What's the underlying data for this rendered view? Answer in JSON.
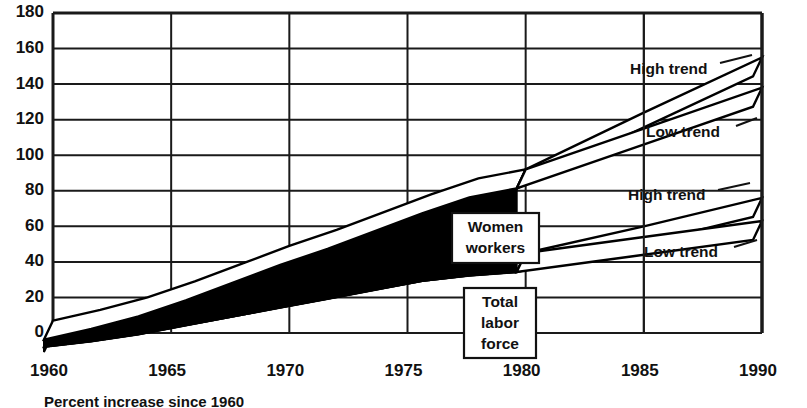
{
  "chart_data": {
    "type": "area",
    "title": "",
    "subtitle": "",
    "xlabel": "",
    "ylabel": "",
    "xlim": [
      1960,
      1990
    ],
    "ylim": [
      0,
      180
    ],
    "grid": true,
    "legend_position": "in-plot callouts",
    "style": "3d-stacked-area-with-projection-fan",
    "y_ticks": [
      0,
      20,
      40,
      60,
      80,
      100,
      120,
      140,
      160,
      180
    ],
    "x_ticks": [
      1960,
      1965,
      1970,
      1975,
      1980,
      1985,
      1990
    ],
    "x_tick_labels": [
      "1960",
      "1965",
      "1970",
      "1975",
      "1980",
      "1985",
      "1990"
    ],
    "y_tick_labels": [
      "0",
      "20",
      "40",
      "60",
      "80",
      "100",
      "120",
      "140",
      "160",
      "180"
    ],
    "annotations": [
      {
        "text": "Women workers",
        "lines": [
          "Women",
          "workers"
        ],
        "x": 1978,
        "y": 52
      },
      {
        "text": "Total labor force",
        "lines": [
          "Total",
          "labor",
          "force"
        ],
        "x": 1978,
        "y": 18
      },
      {
        "text": "High trend",
        "series": "total-labor-force-high",
        "x": 1986.5,
        "y": 150
      },
      {
        "text": "Low trend",
        "series": "total-labor-force-low",
        "x": 1986.5,
        "y": 124
      },
      {
        "text": "High trend",
        "series": "women-workers-high",
        "x": 1986.5,
        "y": 70
      },
      {
        "text": "Low trend",
        "series": "women-workers-low",
        "x": 1986.5,
        "y": 47
      }
    ],
    "x": [
      1960,
      1962,
      1964,
      1966,
      1968,
      1970,
      1972,
      1974,
      1976,
      1978,
      1980
    ],
    "series": [
      {
        "name": "Total labor force",
        "role": "lower-band-top",
        "fill": "#000000",
        "values": [
          3,
          6,
          10,
          15,
          20,
          25,
          30,
          35,
          40,
          43,
          45
        ]
      },
      {
        "name": "Women workers",
        "role": "upper-band-top (cumulative)",
        "fill": "#000000",
        "values": [
          7,
          13,
          20,
          29,
          39,
          49,
          58,
          68,
          78,
          87,
          92
        ]
      }
    ],
    "projections": [
      {
        "name": "Total labor force High trend",
        "x": [
          1980,
          1985,
          1990
        ],
        "values": [
          92,
          124,
          155
        ]
      },
      {
        "name": "Total labor force Low trend",
        "x": [
          1980,
          1985,
          1990
        ],
        "values": [
          92,
          115,
          138
        ]
      },
      {
        "name": "Women workers High trend",
        "x": [
          1980,
          1985,
          1990
        ],
        "values": [
          45,
          60,
          76
        ]
      },
      {
        "name": "Women workers Low trend",
        "x": [
          1980,
          1985,
          1990
        ],
        "values": [
          45,
          54,
          63
        ]
      }
    ]
  },
  "labels": {
    "women_workers_line1": "Women",
    "women_workers_line2": "workers",
    "total_line1": "Total",
    "total_line2": "labor",
    "total_line3": "force",
    "high_trend_upper": "High trend",
    "low_trend_upper": "Low trend",
    "high_trend_lower": "High trend",
    "low_trend_lower": "Low trend"
  },
  "colors": {
    "ink": "#111111",
    "fill": "#000000",
    "background": "#ffffff",
    "grid": "#222222"
  },
  "caption": {
    "text": "Percent increase since 1960"
  }
}
